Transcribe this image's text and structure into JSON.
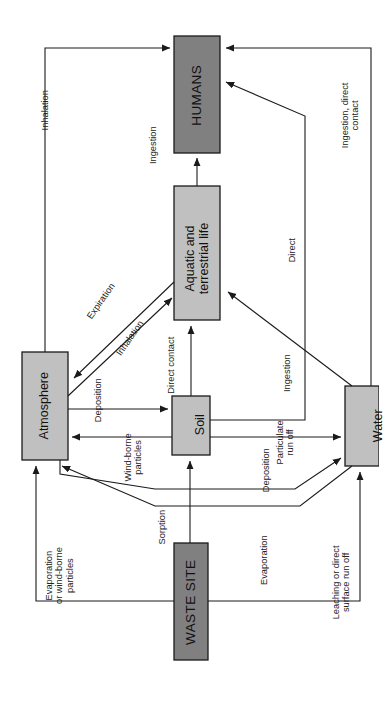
{
  "diagram": {
    "type": "flow-diagram",
    "orientation": "rotated-90-counterclockwise",
    "colors": {
      "dark_node_fill": "#808080",
      "light_node_fill": "#c0c0c0",
      "stroke": "#1a1a1a",
      "background": "#ffffff"
    },
    "nodes": [
      {
        "id": "humans",
        "label": "HUMANS",
        "fill": "dark"
      },
      {
        "id": "biota",
        "label": "Aquatic and\nterrestrial life",
        "fill": "light"
      },
      {
        "id": "atmos",
        "label": "Atmosphere",
        "fill": "light"
      },
      {
        "id": "soil",
        "label": "Soil",
        "fill": "light"
      },
      {
        "id": "water",
        "label": "Water",
        "fill": "light"
      },
      {
        "id": "waste",
        "label": "WASTE SITE",
        "fill": "dark"
      }
    ],
    "edges": [
      {
        "id": "e1",
        "label": "Inhalation",
        "from": "atmos",
        "to": "humans"
      },
      {
        "id": "e2",
        "label": "Ingestion",
        "from": "biota",
        "to": "humans"
      },
      {
        "id": "e3",
        "label": "Ingestion, direct\ncontact",
        "from": "water",
        "to": "humans"
      },
      {
        "id": "e4",
        "label": "Direct",
        "from": "soil",
        "to": "humans"
      },
      {
        "id": "e5",
        "label": "Expiration",
        "from": "biota",
        "to": "atmos"
      },
      {
        "id": "e6",
        "label": "Inhalation",
        "from": "atmos",
        "to": "biota"
      },
      {
        "id": "e7",
        "label": "Direct contact",
        "from": "soil",
        "to": "biota"
      },
      {
        "id": "e8",
        "label": "Ingestion",
        "from": "water",
        "to": "biota"
      },
      {
        "id": "e9",
        "label": "Deposition",
        "from": "atmos",
        "to": "soil"
      },
      {
        "id": "e10",
        "label": "Wind-borne\nparticles",
        "from": "soil",
        "to": "atmos"
      },
      {
        "id": "e11",
        "label": "Particulate\nrun off",
        "from": "soil",
        "to": "water"
      },
      {
        "id": "e12",
        "label": "Deposition",
        "from": "atmos",
        "to": "water"
      },
      {
        "id": "e13",
        "label": "Evaporation\nor wind-borne\nparticles",
        "from": "water",
        "to": "atmos"
      },
      {
        "id": "e14",
        "label": "Sorption",
        "from": "waste",
        "to": "soil"
      },
      {
        "id": "e15",
        "label": "Evaporation",
        "from": "waste",
        "to": "atmos"
      },
      {
        "id": "e16",
        "label": "Leaching or direct\nsurface run off",
        "from": "waste",
        "to": "water"
      }
    ]
  }
}
